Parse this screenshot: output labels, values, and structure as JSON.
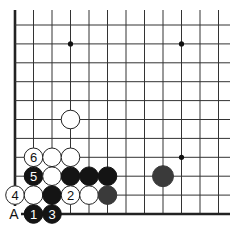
{
  "diagram": {
    "type": "go-board-fragment",
    "columns": 12,
    "rows": 11,
    "edges": [
      "left",
      "bottom"
    ],
    "origin": {
      "x": 15,
      "y": 25
    },
    "spacing": {
      "x": 18.5,
      "y": 18.9
    },
    "stone_radius": 9.3,
    "colors": {
      "line": "#333333",
      "edge": "#222222",
      "black": "#141414",
      "dark_gray": "#3a3a3a",
      "white_fill": "#ffffff",
      "white_stroke": "#222222",
      "star": "#111111"
    },
    "star_points": [
      {
        "col": 3,
        "row": 1
      },
      {
        "col": 9,
        "row": 1
      },
      {
        "col": 9,
        "row": 7
      }
    ],
    "stones": [
      {
        "color": "white",
        "col": 3,
        "row": 5,
        "label": ""
      },
      {
        "color": "white",
        "col": 1,
        "row": 7,
        "label": "6"
      },
      {
        "color": "white",
        "col": 2,
        "row": 7,
        "label": ""
      },
      {
        "color": "white",
        "col": 3,
        "row": 7,
        "label": ""
      },
      {
        "color": "black",
        "col": 1,
        "row": 8,
        "label": "5"
      },
      {
        "color": "white",
        "col": 2,
        "row": 8,
        "label": ""
      },
      {
        "color": "black",
        "col": 3,
        "row": 8,
        "label": ""
      },
      {
        "color": "black",
        "col": 4,
        "row": 8,
        "label": ""
      },
      {
        "color": "black",
        "col": 5,
        "row": 8,
        "label": ""
      },
      {
        "color": "dark_gray",
        "col": 8,
        "row": 8,
        "label": "",
        "large": true
      },
      {
        "color": "white",
        "col": 0,
        "row": 9,
        "label": "4"
      },
      {
        "color": "white",
        "col": 1,
        "row": 9,
        "label": ""
      },
      {
        "color": "black",
        "col": 2,
        "row": 9,
        "label": ""
      },
      {
        "color": "white",
        "col": 3,
        "row": 9,
        "label": "2"
      },
      {
        "color": "white",
        "col": 4,
        "row": 9,
        "label": ""
      },
      {
        "color": "dark_gray",
        "col": 5,
        "row": 9,
        "label": ""
      },
      {
        "color": "black",
        "col": 1,
        "row": 10,
        "label": "1"
      },
      {
        "color": "black",
        "col": 2,
        "row": 10,
        "label": "3"
      }
    ],
    "point_labels": [
      {
        "text": "A",
        "col": 0,
        "row": 10
      }
    ]
  }
}
